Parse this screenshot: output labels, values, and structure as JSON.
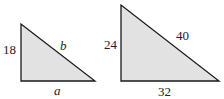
{
  "colors": {
    "fill": "#e2e2e2",
    "stroke": "#1a1a1a",
    "background": "#ffffff"
  },
  "triangles": [
    {
      "name": "left-triangle",
      "vertices": [
        [
          21,
          24
        ],
        [
          21,
          81
        ],
        [
          95,
          81
        ]
      ],
      "labels": {
        "left_leg": "18",
        "hypotenuse": "b",
        "base": "a"
      }
    },
    {
      "name": "right-triangle",
      "vertices": [
        [
          121,
          5
        ],
        [
          121,
          81
        ],
        [
          219,
          81
        ]
      ],
      "labels": {
        "left_leg": "24",
        "hypotenuse": "40",
        "base": "32"
      }
    }
  ]
}
